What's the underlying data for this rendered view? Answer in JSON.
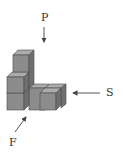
{
  "diagram": {
    "labels": {
      "top_view": "P",
      "side_view": "S",
      "front_view": "F"
    },
    "colors": {
      "front_face": "#8c8c8c",
      "top_face": "#ababab",
      "side_face": "#6f6f6f",
      "outline": "#4a4a4a",
      "arrow": "#444444"
    },
    "cube_count": 6
  }
}
